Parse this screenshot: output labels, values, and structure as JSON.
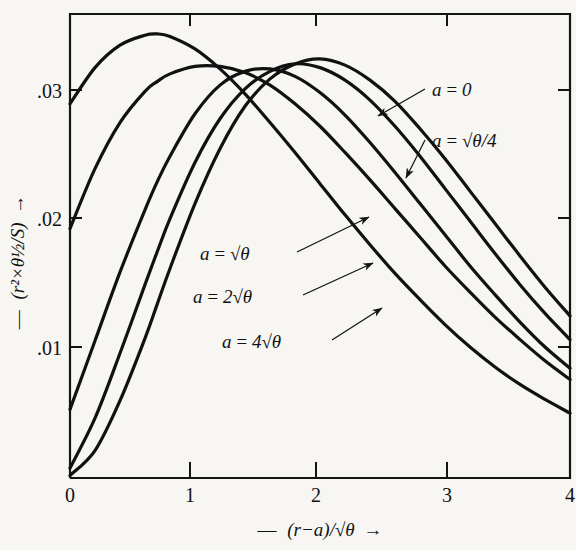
{
  "figure": {
    "background_color": "#f7f6f3",
    "ink_color": "#111111"
  },
  "axes": {
    "x_title_parts": {
      "dash": "—",
      "body": "(r−a)/√θ",
      "arrow": "→"
    },
    "y_title_parts": {
      "dash": "—",
      "body": "(r²×θ½/S)",
      "arrow": "→"
    },
    "x_ticks": [
      "0",
      "1",
      "2",
      "3",
      "4"
    ],
    "y_ticks": [
      ".01",
      ".02",
      ".03"
    ]
  },
  "annotations": [
    {
      "id": "a0",
      "text": "a = 0"
    },
    {
      "id": "aq4",
      "text": "a = √θ/4"
    },
    {
      "id": "a1",
      "text": "a = √θ"
    },
    {
      "id": "a2",
      "text": "a = 2√θ"
    },
    {
      "id": "a4",
      "text": "a = 4√θ"
    }
  ],
  "chart_data": {
    "type": "line",
    "title": "",
    "xlabel": "— (r−a)/√θ →",
    "ylabel": "— (r²×θ½/S) →",
    "xlim": [
      0,
      4
    ],
    "ylim": [
      0,
      0.0372
    ],
    "xticks": [
      0,
      1,
      2,
      3,
      4
    ],
    "yticks": [
      0.01,
      0.02,
      0.03
    ],
    "grid": false,
    "legend": "inline-annotations",
    "x": [
      0,
      0.2,
      0.4,
      0.6,
      0.7,
      0.8,
      1.0,
      1.2,
      1.4,
      1.6,
      1.8,
      2.0,
      2.2,
      2.4,
      2.6,
      2.8,
      3.0,
      3.2,
      3.4,
      3.6,
      3.8,
      4.0
    ],
    "series": [
      {
        "name": "a = 0",
        "label": "a = 0",
        "peak_x": 0.68,
        "peak_y": 0.0355,
        "values": [
          0.03,
          0.0329,
          0.0347,
          0.0355,
          0.0356,
          0.0354,
          0.0344,
          0.0328,
          0.0308,
          0.0285,
          0.0261,
          0.0236,
          0.0211,
          0.0187,
          0.0164,
          0.0143,
          0.0123,
          0.0105,
          0.0089,
          0.0075,
          0.0063,
          0.0052
        ]
      },
      {
        "name": "a = sqrt(theta)/4",
        "label": "a = √θ/4",
        "peak_x": 1.18,
        "peak_y": 0.033,
        "values": [
          0.02,
          0.0248,
          0.0285,
          0.031,
          0.0318,
          0.0324,
          0.033,
          0.033,
          0.0325,
          0.0315,
          0.03,
          0.0282,
          0.0261,
          0.0239,
          0.0216,
          0.0193,
          0.017,
          0.0149,
          0.0129,
          0.0111,
          0.0094,
          0.0079
        ]
      },
      {
        "name": "a = sqrt(theta)",
        "label": "a = √θ",
        "peak_x": 1.5,
        "peak_y": 0.0328,
        "values": [
          0.0055,
          0.011,
          0.0165,
          0.0215,
          0.0238,
          0.0258,
          0.0292,
          0.0315,
          0.0326,
          0.0328,
          0.0322,
          0.0309,
          0.0291,
          0.0269,
          0.0245,
          0.022,
          0.0195,
          0.017,
          0.0147,
          0.0125,
          0.0105,
          0.0088
        ]
      },
      {
        "name": "a = 2 sqrt(theta)",
        "label": "a = 2√θ",
        "peak_x": 1.76,
        "peak_y": 0.0332,
        "values": [
          0.0008,
          0.0048,
          0.01,
          0.0155,
          0.0182,
          0.0208,
          0.0253,
          0.0288,
          0.0312,
          0.0326,
          0.0332,
          0.0329,
          0.0319,
          0.0303,
          0.0282,
          0.0258,
          0.0232,
          0.0206,
          0.018,
          0.0155,
          0.0132,
          0.0111
        ]
      },
      {
        "name": "a = 4 sqrt(theta)",
        "label": "a = 4√θ",
        "peak_x": 2.02,
        "peak_y": 0.0336,
        "values": [
          0.0002,
          0.0022,
          0.0062,
          0.0112,
          0.014,
          0.0168,
          0.022,
          0.0264,
          0.0298,
          0.032,
          0.0332,
          0.0336,
          0.0331,
          0.0319,
          0.0302,
          0.028,
          0.0256,
          0.023,
          0.0204,
          0.0178,
          0.0153,
          0.013
        ]
      }
    ]
  }
}
